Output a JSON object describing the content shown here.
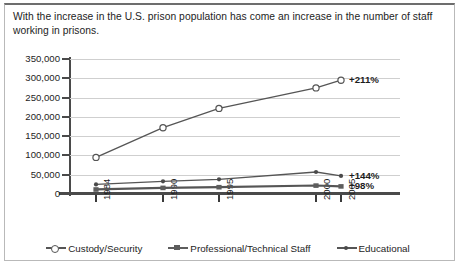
{
  "caption": "With the increase in the U.S. prison population has come an increase in the number of staff working in prisons.",
  "colors": {
    "line": "#555555",
    "grid": "#cfcfcf",
    "axis": "#4a4a4a",
    "text": "#1d1d1d"
  },
  "legend": {
    "items": [
      {
        "label": "Custody/Security",
        "marker": "open-circle-marker"
      },
      {
        "label": "Professional/Technical Staff",
        "marker": "filled-square-marker"
      },
      {
        "label": "Educational",
        "marker": "filled-dot-marker"
      }
    ]
  },
  "annotations": [
    {
      "text": "+211%",
      "series": "Custody/Security"
    },
    {
      "text": "+144%",
      "series": "Educational"
    },
    {
      "text": "+98%",
      "series": "Professional/Technical Staff"
    }
  ],
  "chart_data": {
    "type": "line",
    "title": "",
    "subtitle": "",
    "xlabel": "",
    "ylabel": "",
    "x": [
      "1984",
      "1990",
      "1995",
      "2000",
      "2005"
    ],
    "categories": [
      "1984",
      "1990",
      "1995",
      "2000",
      "2005"
    ],
    "ylim": [
      0,
      350000
    ],
    "ytick_values": [
      0,
      50000,
      100000,
      150000,
      200000,
      250000,
      300000,
      350000
    ],
    "ytick_labels": [
      "0",
      "50,000",
      "100,000",
      "150,000",
      "200,000",
      "250,000",
      "300,000",
      "350,000"
    ],
    "xtick_labels": [
      "1984",
      "1990",
      "1995",
      "2000",
      "2005"
    ],
    "xtick_rotation": 90,
    "grid": true,
    "legend_position": "bottom",
    "series": [
      {
        "name": "Custody/Security",
        "marker": "open-circle",
        "values": [
          95000,
          172000,
          222000,
          275000,
          295000
        ],
        "end_label": "+211%"
      },
      {
        "name": "Educational",
        "marker": "filled-dot",
        "values": [
          25000,
          33000,
          38000,
          57000,
          47000
        ],
        "end_label": "+144%"
      },
      {
        "name": "Professional/Technical Staff",
        "marker": "filled-square",
        "values": [
          12000,
          16000,
          18000,
          22000,
          20000
        ],
        "end_label": "+98%"
      }
    ]
  }
}
